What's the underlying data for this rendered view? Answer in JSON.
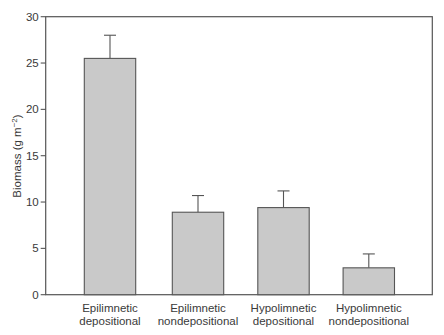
{
  "chart_data": {
    "type": "bar",
    "title": "",
    "xlabel": "",
    "ylabel": "Biomass (g m",
    "ylabel_superscript": "−2",
    "ylabel_close": ")",
    "ylim": [
      0,
      30
    ],
    "yticks": [
      0,
      5,
      10,
      15,
      20,
      25,
      30
    ],
    "grid": false,
    "frame": "box",
    "categories": [
      [
        "Epilimnetic",
        "depositional"
      ],
      [
        "Epilimnetic",
        "nondepositional"
      ],
      [
        "Hypolimnetic",
        "depositional"
      ],
      [
        "Hypolimnetic",
        "nondepositional"
      ]
    ],
    "values": [
      25.5,
      8.9,
      9.4,
      2.9
    ],
    "error_upper": [
      28.0,
      10.7,
      11.2,
      4.4
    ],
    "error_bars": "upper-only",
    "colors": {
      "bar_fill": "#c9c9c9",
      "bar_stroke": "#555555",
      "axis": "#555555"
    }
  }
}
